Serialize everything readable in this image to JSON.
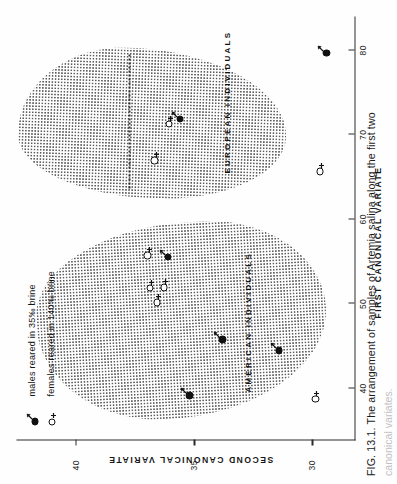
{
  "figure": {
    "caption_prefix": "FIG. 13.1.",
    "caption_text_1": "The arrangement of samples of",
    "caption_species": "Artemia salina",
    "caption_text_2": "along the first two",
    "caption_line2": "canonical variates."
  },
  "axes": {
    "x": {
      "title": "FIRST CANONICAL VARIATE",
      "ticks": [
        40,
        50,
        60,
        70,
        80
      ],
      "min": 34,
      "max": 84
    },
    "y": {
      "title": "SECOND CANONICAL VARIATE",
      "ticks": [
        40,
        35,
        30
      ],
      "min": 28.2,
      "max": 42.5
    }
  },
  "legend": {
    "items": [
      {
        "icon": "male-filled-circle-icon",
        "symbol": "male",
        "fill": "filled",
        "label": "males reared in 35‰ brine"
      },
      {
        "icon": "female-open-circle-icon",
        "symbol": "female",
        "fill": "open",
        "label": "females reared in 140‰ brine"
      }
    ]
  },
  "clusters": [
    {
      "id": "american",
      "label": "AMERICAN INDIVIDUALS"
    },
    {
      "id": "european",
      "label": "EUROPEAN INDIVIDUALS"
    }
  ],
  "colors": {
    "ink": "#1a1a1a",
    "stipple": "#3a3a3a",
    "paper": "#fefefe"
  },
  "chart_data": {
    "type": "scatter",
    "title": "The arrangement of samples of Artemia salina along the first two canonical variates",
    "xlabel": "FIRST CANONICAL VARIATE",
    "ylabel": "SECOND CANONICAL VARIATE",
    "xlim": [
      34,
      84
    ],
    "ylim": [
      28.2,
      42.5
    ],
    "xticks": [
      40,
      50,
      60,
      70,
      80
    ],
    "yticks": [
      30,
      35,
      40
    ],
    "grid": false,
    "legend_position": "top-left",
    "series": [
      {
        "name": "males reared in 35‰ brine",
        "symbol": "male",
        "fill": "filled",
        "points": [
          {
            "x": 39.3,
            "y": 35.2,
            "group": "american"
          },
          {
            "x": 45.9,
            "y": 33.8,
            "group": "american"
          },
          {
            "x": 44.6,
            "y": 31.4,
            "group": "american"
          },
          {
            "x": 55.7,
            "y": 36.1,
            "group": "american"
          },
          {
            "x": 72.0,
            "y": 35.6,
            "group": "european"
          },
          {
            "x": 79.8,
            "y": 29.4,
            "group": "european"
          }
        ]
      },
      {
        "name": "females reared in 140‰ brine",
        "symbol": "female",
        "fill": "open",
        "points": [
          {
            "x": 38.9,
            "y": 29.8,
            "group": "american"
          },
          {
            "x": 50.3,
            "y": 36.5,
            "group": "american"
          },
          {
            "x": 52.1,
            "y": 36.2,
            "group": "american"
          },
          {
            "x": 52.0,
            "y": 36.8,
            "group": "american"
          },
          {
            "x": 55.9,
            "y": 36.9,
            "group": "american"
          },
          {
            "x": 67.1,
            "y": 36.6,
            "group": "european"
          },
          {
            "x": 71.4,
            "y": 36.0,
            "group": "european"
          },
          {
            "x": 65.8,
            "y": 29.6,
            "group": "european"
          }
        ]
      }
    ],
    "annotations": [
      {
        "text": "AMERICAN INDIVIDUALS",
        "x": 47.0,
        "y": 31.9
      },
      {
        "text": "EUROPEAN INDIVIDUALS",
        "x": 73.5,
        "y": 32.3
      }
    ]
  }
}
